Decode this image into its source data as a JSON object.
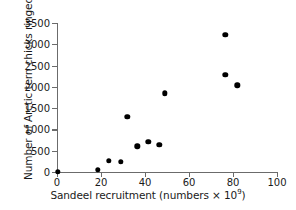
{
  "chart_data": {
    "type": "scatter",
    "title": "",
    "xlabel": "Sandeel recruitment (numbers × 10⁹)",
    "xlabel_text": "Sandeel recruitment (numbers × 10",
    "xlabel_sup": "9",
    "xlabel_tail": ")",
    "ylabel": "Number of Arctic tern chicks ringed",
    "xlim": [
      0,
      100
    ],
    "ylim": [
      0,
      3500
    ],
    "xticks": [
      0,
      20,
      40,
      60,
      80,
      100
    ],
    "yticks": [
      0,
      500,
      1000,
      1500,
      2000,
      2500,
      3000,
      3500
    ],
    "xtick_labels": [
      "0",
      "20",
      "40",
      "60",
      "80",
      "100"
    ],
    "ytick_labels": [
      "0",
      "500",
      "1000",
      "1500",
      "2000",
      "2500",
      "3000",
      "3500"
    ],
    "grid": false,
    "legend": false,
    "marker": "filled-circle",
    "marker_color": "#000000",
    "axis_color": "#6b6b6b",
    "points": [
      {
        "x": 0.5,
        "y": 0
      },
      {
        "x": 18.5,
        "y": 50
      },
      {
        "x": 23.5,
        "y": 270
      },
      {
        "x": 29.0,
        "y": 245
      },
      {
        "x": 32.0,
        "y": 1290
      },
      {
        "x": 36.5,
        "y": 600
      },
      {
        "x": 41.5,
        "y": 710
      },
      {
        "x": 46.5,
        "y": 640
      },
      {
        "x": 49.0,
        "y": 1850
      },
      {
        "x": 76.5,
        "y": 3220
      },
      {
        "x": 76.5,
        "y": 2290
      },
      {
        "x": 82.0,
        "y": 2035
      }
    ]
  }
}
